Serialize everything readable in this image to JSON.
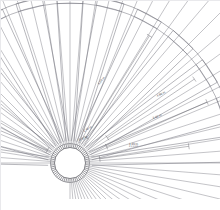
{
  "drawing": {
    "title": "radial-fan-assembly-plan",
    "type": "cad-line-drawing",
    "background_color": "#ffffff",
    "line_color": "#6e6e78",
    "heavy_line_color": "#4a4a52",
    "label_color": "#4a4a52",
    "canvas": {
      "width": 220,
      "height": 210
    },
    "hub": {
      "center_x": 70,
      "center_y": 163,
      "inner_radius": 15.5,
      "outer_ring_radius": 19.5,
      "tooth_count": 60,
      "label": "central-hub"
    },
    "spokes": {
      "count": 60,
      "start_angle_deg": -180,
      "end_angle_deg": 90,
      "label": "radial-spokes"
    },
    "blades": {
      "count": 13,
      "label": "blade-panels",
      "inner_radius": 22,
      "outer_radius": 168,
      "half_width_deg": 4.6,
      "sector_start_deg": -175,
      "sector_end_deg": -5
    },
    "outer_arcs": {
      "count": 2,
      "radius_outer": 168,
      "radius_inner": 160,
      "label": "outer-rim-arcs"
    },
    "dimensions": [
      {
        "id": "dim-1",
        "value": "1.20 m",
        "note": "2 x 0.60",
        "x": 129,
        "y": 143,
        "rotation": -1
      },
      {
        "id": "dim-2",
        "value": "3.60 m",
        "note": "",
        "x": 153,
        "y": 117,
        "rotation": -19
      },
      {
        "id": "dim-3",
        "value": "4.80 m",
        "note": "",
        "x": 157,
        "y": 95,
        "rotation": -26
      },
      {
        "id": "dim-4",
        "value": "6.00 m",
        "note": "",
        "x": 99,
        "y": 83,
        "rotation": -52
      },
      {
        "id": "dim-5",
        "value": "2.40 m",
        "note": "",
        "x": 84,
        "y": 130,
        "rotation": -29
      },
      {
        "id": "dim-6",
        "value": "0.60 m",
        "note": "",
        "x": 79,
        "y": 139,
        "rotation": -22
      }
    ]
  }
}
